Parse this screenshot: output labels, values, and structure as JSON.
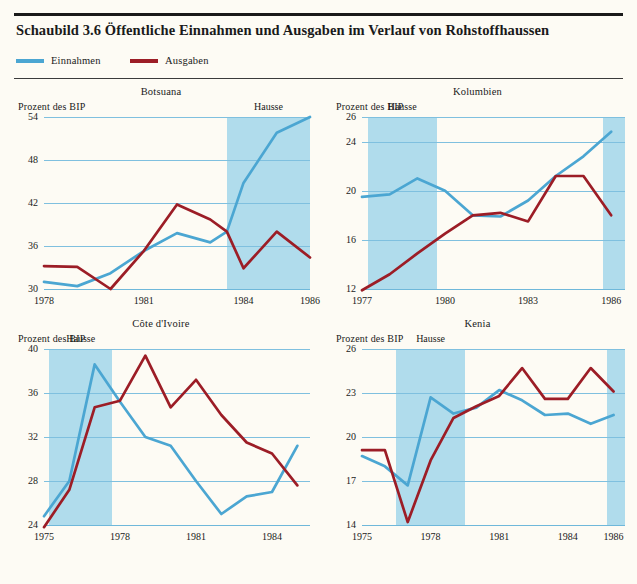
{
  "header": {
    "title": "Schaubild 3.6 Öffentliche Einnahmen und Ausgaben im Verlauf von Rohstoffhaussen"
  },
  "legend": {
    "revenue_label": "Einnahmen",
    "expenditure_label": "Ausgaben",
    "revenue_color": "#4ba6d2",
    "expenditure_color": "#9c1d26",
    "band_color": "#b0dcec"
  },
  "labels": {
    "axis_caption": "Prozent des BIP",
    "boom_label": "Hausse"
  },
  "chart_data": [
    {
      "type": "line",
      "title": "Botsuana",
      "xlabel": "",
      "ylabel": "Prozent des BIP",
      "ylim": [
        30,
        54
      ],
      "yticks": [
        30,
        36,
        42,
        48,
        54
      ],
      "xlim": [
        1978,
        1986
      ],
      "xticks": [
        1978,
        1981,
        1984,
        1986
      ],
      "grid": true,
      "bands": [
        {
          "label": "Hausse",
          "from": 1983.5,
          "to": 1986
        }
      ],
      "x": [
        1978,
        1979,
        1980,
        1981,
        1982,
        1983,
        1983.5,
        1984,
        1985,
        1986
      ],
      "series": [
        {
          "name": "Einnahmen",
          "values": [
            31.0,
            30.4,
            32.2,
            35.3,
            37.8,
            36.5,
            38.0,
            44.8,
            51.8,
            54.0
          ]
        },
        {
          "name": "Ausgaben",
          "values": [
            33.2,
            33.1,
            30.0,
            35.3,
            41.8,
            39.7,
            38.0,
            32.9,
            38.0,
            34.4
          ]
        }
      ]
    },
    {
      "type": "line",
      "title": "Kolumbien",
      "xlabel": "",
      "ylabel": "Prozent des BIP",
      "ylim": [
        12,
        26
      ],
      "yticks": [
        12,
        16,
        20,
        24,
        26
      ],
      "xlim": [
        1977,
        1986.5
      ],
      "xticks": [
        1977,
        1980,
        1983,
        1986
      ],
      "grid": true,
      "bands": [
        {
          "label": "Hausse",
          "from": 1977.2,
          "to": 1979.7
        },
        {
          "label": "",
          "from": 1985.7,
          "to": 1986.5
        }
      ],
      "x": [
        1977,
        1978,
        1979,
        1980,
        1981,
        1982,
        1983,
        1984,
        1985,
        1986
      ],
      "series": [
        {
          "name": "Einnahmen",
          "values": [
            19.5,
            19.7,
            21.0,
            20.0,
            18.0,
            17.9,
            19.2,
            21.2,
            22.8,
            24.8
          ]
        },
        {
          "name": "Ausgaben",
          "values": [
            11.9,
            13.2,
            14.9,
            16.5,
            18.0,
            18.2,
            17.5,
            21.2,
            21.2,
            18.0
          ]
        }
      ]
    },
    {
      "type": "line",
      "title": "Côte d'Ivoire",
      "xlabel": "",
      "ylabel": "Prozent des BIP",
      "ylim": [
        24,
        40
      ],
      "yticks": [
        24,
        28,
        32,
        36,
        40
      ],
      "xlim": [
        1975,
        1985.5
      ],
      "xticks": [
        1975,
        1978,
        1981,
        1984
      ],
      "grid": true,
      "bands": [
        {
          "label": "Hausse",
          "from": 1975.2,
          "to": 1977.7
        }
      ],
      "x": [
        1975,
        1976,
        1977,
        1978,
        1979,
        1980,
        1981,
        1982,
        1983,
        1984,
        1985
      ],
      "series": [
        {
          "name": "Einnahmen",
          "values": [
            24.8,
            28.0,
            38.6,
            35.2,
            32.0,
            31.2,
            28.0,
            25.0,
            26.6,
            27.0,
            31.2
          ]
        },
        {
          "name": "Ausgaben",
          "values": [
            23.8,
            27.2,
            34.7,
            35.3,
            39.4,
            34.7,
            37.2,
            34.0,
            31.5,
            30.5,
            27.6
          ]
        }
      ]
    },
    {
      "type": "line",
      "title": "Kenia",
      "xlabel": "",
      "ylabel": "Prozent des BIP",
      "ylim": [
        14,
        26
      ],
      "yticks": [
        14,
        17,
        20,
        23,
        26
      ],
      "xlim": [
        1975,
        1986.5
      ],
      "xticks": [
        1975,
        1978,
        1981,
        1984,
        1986
      ],
      "grid": true,
      "bands": [
        {
          "label": "Hausse",
          "from": 1976.5,
          "to": 1979.5
        },
        {
          "label": "",
          "from": 1985.7,
          "to": 1986.5
        }
      ],
      "x": [
        1975,
        1976,
        1977,
        1978,
        1979,
        1980,
        1981,
        1982,
        1983,
        1984,
        1985,
        1986
      ],
      "series": [
        {
          "name": "Einnahmen",
          "values": [
            18.7,
            18.0,
            16.7,
            22.7,
            21.6,
            22.0,
            23.2,
            22.5,
            21.5,
            21.6,
            20.9,
            21.5
          ]
        },
        {
          "name": "Ausgaben",
          "values": [
            19.1,
            19.1,
            14.2,
            18.4,
            21.3,
            22.1,
            22.8,
            24.7,
            22.6,
            22.6,
            24.7,
            23.1
          ]
        }
      ]
    }
  ]
}
